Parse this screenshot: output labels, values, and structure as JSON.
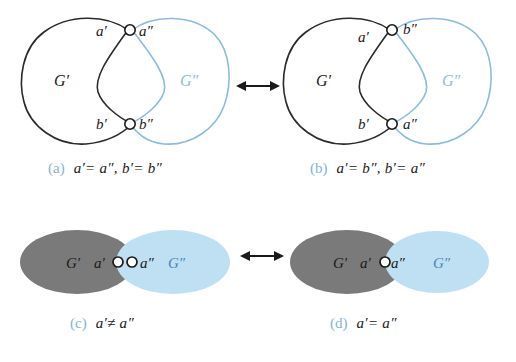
{
  "figure": {
    "background_color": "#ffffff",
    "colors": {
      "graph_prime_stroke": "#2b2b2b",
      "graph_dprime_stroke": "#8cbcdc",
      "caption_tag": "#7fb4d8",
      "text": "#1a1a1a",
      "ellipse_gray_fill": "#7a7a7a",
      "ellipse_blue_fill": "#bfe0f2",
      "node_fill": "#ffffff",
      "node_stroke": "#1a1a1a",
      "arrow_color": "#1a1a1a"
    }
  },
  "panels": {
    "a": {
      "tag": "(a)",
      "formula": "a′= a″, b′= b″",
      "region_left_label": "G′",
      "region_right_label": "G″",
      "node_top_left_label": "a′",
      "node_top_right_label": "a″",
      "node_bottom_left_label": "b′",
      "node_bottom_right_label": "b″"
    },
    "b": {
      "tag": "(b)",
      "formula": "a′= b″, b′= a″",
      "region_left_label": "G′",
      "region_right_label": "G″",
      "node_top_left_label": "a′",
      "node_top_right_label": "b″",
      "node_bottom_left_label": "b′",
      "node_bottom_right_label": "a″"
    },
    "c": {
      "tag": "(c)",
      "formula": "a′≠ a″",
      "region_left_label": "G′",
      "region_right_label": "G″",
      "node_left_label": "a′",
      "node_right_label": "a″"
    },
    "d": {
      "tag": "(d)",
      "formula": "a′= a″",
      "region_left_label": "G′",
      "region_right_label": "G″",
      "node_left_label": "a′",
      "node_right_label": "a″"
    }
  },
  "arrows": {
    "top": {
      "name": "double-headed-arrow",
      "glyph": "↔"
    },
    "bottom": {
      "name": "double-headed-arrow",
      "glyph": "↔"
    }
  }
}
